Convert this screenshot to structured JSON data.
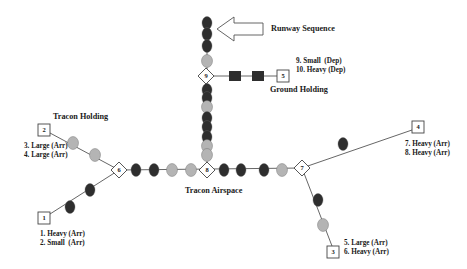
{
  "colors": {
    "dark": "#2e2e2e",
    "gray": "#b4b4b4",
    "line": "#555555",
    "text": "#1a1a1a"
  },
  "labels": {
    "runway_sequence": "Runway Sequence",
    "ground_holding": "Ground Holding",
    "tracon_holding": "Tracon Holding",
    "tracon_airspace": "Tracon Airspace"
  },
  "sources": [
    {
      "id": "1",
      "x": 44,
      "y": 218,
      "lines": [
        "1. Heavy (Arr)",
        "2. Small  (Arr)"
      ],
      "label_x": 40,
      "label_y": 236
    },
    {
      "id": "2",
      "x": 44,
      "y": 130,
      "lines": [
        "3. Large (Arr)",
        "4. Large (Arr)"
      ],
      "label_x": 24,
      "label_y": 148
    },
    {
      "id": "3",
      "x": 333,
      "y": 252,
      "lines": [
        "5. Large (Arr)",
        "6. Heavy (Arr)"
      ],
      "label_x": 344,
      "label_y": 245
    },
    {
      "id": "4",
      "x": 418,
      "y": 127,
      "lines": [
        "7. Heavy (Arr)",
        "8. Heavy (Arr)"
      ],
      "label_x": 405,
      "label_y": 146
    },
    {
      "id": "5",
      "x": 283,
      "y": 76,
      "lines": [
        "9. Small  (Dep)",
        "10. Heavy (Dep)"
      ],
      "label_x": 296,
      "label_y": 63
    }
  ],
  "junctions": [
    {
      "id": "6",
      "x": 119,
      "y": 170
    },
    {
      "id": "7",
      "x": 302,
      "y": 168
    },
    {
      "id": "8",
      "x": 207,
      "y": 170
    },
    {
      "id": "9",
      "x": 206,
      "y": 76
    }
  ],
  "aircraft": [
    {
      "x": 207,
      "y": 23,
      "type": "dark"
    },
    {
      "x": 207,
      "y": 34,
      "type": "dark"
    },
    {
      "x": 207,
      "y": 46,
      "type": "dark"
    },
    {
      "x": 207,
      "y": 61,
      "type": "gray"
    },
    {
      "x": 207,
      "y": 90,
      "type": "dark"
    },
    {
      "x": 207,
      "y": 98,
      "type": "dark"
    },
    {
      "x": 207,
      "y": 107,
      "type": "gray"
    },
    {
      "x": 207,
      "y": 118,
      "type": "dark"
    },
    {
      "x": 207,
      "y": 127,
      "type": "dark"
    },
    {
      "x": 207,
      "y": 137,
      "type": "dark"
    },
    {
      "x": 207,
      "y": 146,
      "type": "gray"
    },
    {
      "x": 207,
      "y": 155,
      "type": "gray"
    },
    {
      "x": 136,
      "y": 170,
      "type": "dark"
    },
    {
      "x": 154,
      "y": 170,
      "type": "dark"
    },
    {
      "x": 172,
      "y": 170,
      "type": "gray"
    },
    {
      "x": 191,
      "y": 170,
      "type": "gray"
    },
    {
      "x": 224,
      "y": 170,
      "type": "dark"
    },
    {
      "x": 241,
      "y": 170,
      "type": "dark"
    },
    {
      "x": 264,
      "y": 170,
      "type": "dark"
    },
    {
      "x": 282,
      "y": 170,
      "type": "gray"
    },
    {
      "x": 73,
      "y": 143,
      "type": "gray"
    },
    {
      "x": 95,
      "y": 155,
      "type": "gray"
    },
    {
      "x": 90,
      "y": 190,
      "type": "dark"
    },
    {
      "x": 70,
      "y": 207,
      "type": "dark"
    },
    {
      "x": 343,
      "y": 144,
      "type": "dark"
    },
    {
      "x": 318,
      "y": 200,
      "type": "dark"
    },
    {
      "x": 323,
      "y": 225,
      "type": "gray"
    }
  ],
  "ground_aircraft": [
    {
      "x": 235,
      "y": 76
    },
    {
      "x": 258,
      "y": 76
    }
  ]
}
